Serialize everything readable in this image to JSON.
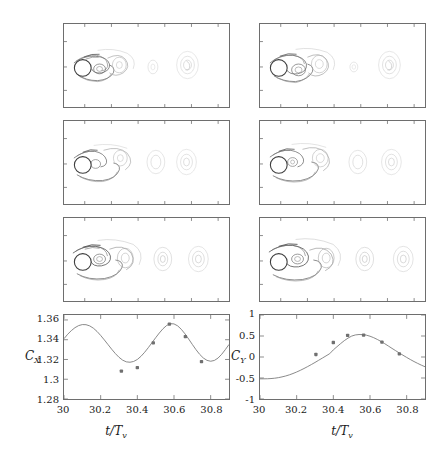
{
  "figure": {
    "title": "",
    "panels_label": "vorticity-contour-panels",
    "n_contour_panels": 6
  },
  "contour_panels": [
    {
      "name": "panel-row1-left",
      "row": 1,
      "col": "left",
      "cylinder_x_frac": 0.115,
      "cylinder_y_frac": 0.52,
      "phase": 0.0
    },
    {
      "name": "panel-row1-right",
      "row": 1,
      "col": "right",
      "cylinder_x_frac": 0.115,
      "cylinder_y_frac": 0.52,
      "phase": 0.17
    },
    {
      "name": "panel-row2-left",
      "row": 2,
      "col": "left",
      "cylinder_x_frac": 0.115,
      "cylinder_y_frac": 0.52,
      "phase": 0.33
    },
    {
      "name": "panel-row2-right",
      "row": 2,
      "col": "right",
      "cylinder_x_frac": 0.115,
      "cylinder_y_frac": 0.52,
      "phase": 0.5
    },
    {
      "name": "panel-row3-left",
      "row": 3,
      "col": "left",
      "cylinder_x_frac": 0.115,
      "cylinder_y_frac": 0.52,
      "phase": 0.67
    },
    {
      "name": "panel-row3-right",
      "row": 3,
      "col": "right",
      "cylinder_x_frac": 0.115,
      "cylinder_y_frac": 0.52,
      "phase": 0.83
    }
  ],
  "colors": {
    "axis": "#6e6e6e",
    "curve": "#7a7a7a",
    "marker": "#707070",
    "contour_dark": "#4a4a4a",
    "contour_mid": "#8c8c8c",
    "contour_light": "#c9c9c9",
    "text": "#1a1a1a",
    "background": "#ffffff"
  },
  "chart_data": [
    {
      "type": "line",
      "name": "cx-time-series",
      "title": "",
      "xlabel": "t/T",
      "xlabel_sub": "v",
      "ylabel": "C",
      "ylabel_sub": "X",
      "xlim": [
        30,
        30.9
      ],
      "ylim": [
        1.28,
        1.365
      ],
      "xticks": [
        30,
        30.2,
        30.4,
        30.6,
        30.8
      ],
      "xticklabels": [
        "30",
        "30.2",
        "30.4",
        "30.6",
        "30.8"
      ],
      "yticks": [
        1.28,
        1.3,
        1.32,
        1.34,
        1.36
      ],
      "yticklabels": [
        "1.28",
        "1.3",
        "1.32",
        "1.34",
        "1.36"
      ],
      "grid": false,
      "legend": "none",
      "line": {
        "x": [
          30.0,
          30.02,
          30.04,
          30.06,
          30.08,
          30.1,
          30.12,
          30.14,
          30.16,
          30.18,
          30.2,
          30.22,
          30.24,
          30.26,
          30.28,
          30.3,
          30.32,
          30.34,
          30.36,
          30.38,
          30.4,
          30.42,
          30.44,
          30.46,
          30.48,
          30.5,
          30.52,
          30.54,
          30.56,
          30.58,
          30.6,
          30.62,
          30.64,
          30.66,
          30.68,
          30.7,
          30.72,
          30.74,
          30.76,
          30.78,
          30.8,
          30.82,
          30.84,
          30.86,
          30.88,
          30.9
        ],
        "y": [
          1.341,
          1.3455,
          1.3492,
          1.3522,
          1.3543,
          1.3553,
          1.3552,
          1.354,
          1.3517,
          1.3484,
          1.3443,
          1.3398,
          1.3351,
          1.3304,
          1.326,
          1.3222,
          1.3193,
          1.3176,
          1.3172,
          1.318,
          1.32,
          1.3232,
          1.3273,
          1.332,
          1.337,
          1.342,
          1.3468,
          1.3511,
          1.3544,
          1.3562,
          1.356,
          1.354,
          1.3505,
          1.3459,
          1.3407,
          1.3352,
          1.3299,
          1.3252,
          1.3215,
          1.3191,
          1.3182,
          1.319,
          1.3214,
          1.3252,
          1.33,
          1.3352
        ]
      },
      "markers": {
        "x": [
          30.313,
          30.4,
          30.487,
          30.575,
          30.662,
          30.75
        ],
        "y": [
          1.3083,
          1.3118,
          1.3368,
          1.3558,
          1.3432,
          1.3178
        ]
      }
    },
    {
      "type": "line",
      "name": "cy-time-series",
      "title": "",
      "xlabel": "t/T",
      "xlabel_sub": "v",
      "ylabel": "C",
      "ylabel_sub": "Y",
      "xlim": [
        30,
        30.9
      ],
      "ylim": [
        -1,
        1
      ],
      "xticks": [
        30,
        30.2,
        30.4,
        30.6,
        30.8
      ],
      "xticklabels": [
        "30",
        "30.2",
        "30.4",
        "30.6",
        "30.8"
      ],
      "yticks": [
        -1,
        -0.5,
        0,
        0.5,
        1
      ],
      "yticklabels": [
        "-1",
        "-0.5",
        "0",
        "0.5",
        "1"
      ],
      "grid": false,
      "legend": "none",
      "line": {
        "x": [
          30.0,
          30.02,
          30.04,
          30.06,
          30.08,
          30.1,
          30.12,
          30.14,
          30.16,
          30.18,
          30.2,
          30.22,
          30.24,
          30.26,
          30.28,
          30.3,
          30.32,
          30.34,
          30.36,
          30.38,
          30.4,
          30.42,
          30.44,
          30.46,
          30.48,
          30.5,
          30.52,
          30.54,
          30.56,
          30.58,
          30.6,
          30.62,
          30.64,
          30.66,
          30.68,
          30.7,
          30.72,
          30.74,
          30.76,
          30.78,
          30.8,
          30.82,
          30.84,
          30.86,
          30.88,
          30.9
        ],
        "y": [
          -0.52,
          -0.52,
          -0.518,
          -0.513,
          -0.505,
          -0.492,
          -0.474,
          -0.452,
          -0.425,
          -0.393,
          -0.357,
          -0.317,
          -0.274,
          -0.228,
          -0.18,
          -0.13,
          -0.078,
          -0.026,
          0.026,
          0.078,
          0.17,
          0.245,
          0.32,
          0.39,
          0.45,
          0.498,
          0.525,
          0.535,
          0.532,
          0.52,
          0.495,
          0.46,
          0.418,
          0.37,
          0.318,
          0.262,
          0.205,
          0.15,
          0.095,
          0.042,
          -0.01,
          -0.06,
          -0.108,
          -0.152,
          -0.194,
          -0.232
        ]
      },
      "markers": {
        "x": [
          30.305,
          30.4,
          30.478,
          30.565,
          30.665,
          30.76
        ],
        "y": [
          0.06,
          0.345,
          0.515,
          0.52,
          0.355,
          0.075
        ]
      }
    }
  ]
}
